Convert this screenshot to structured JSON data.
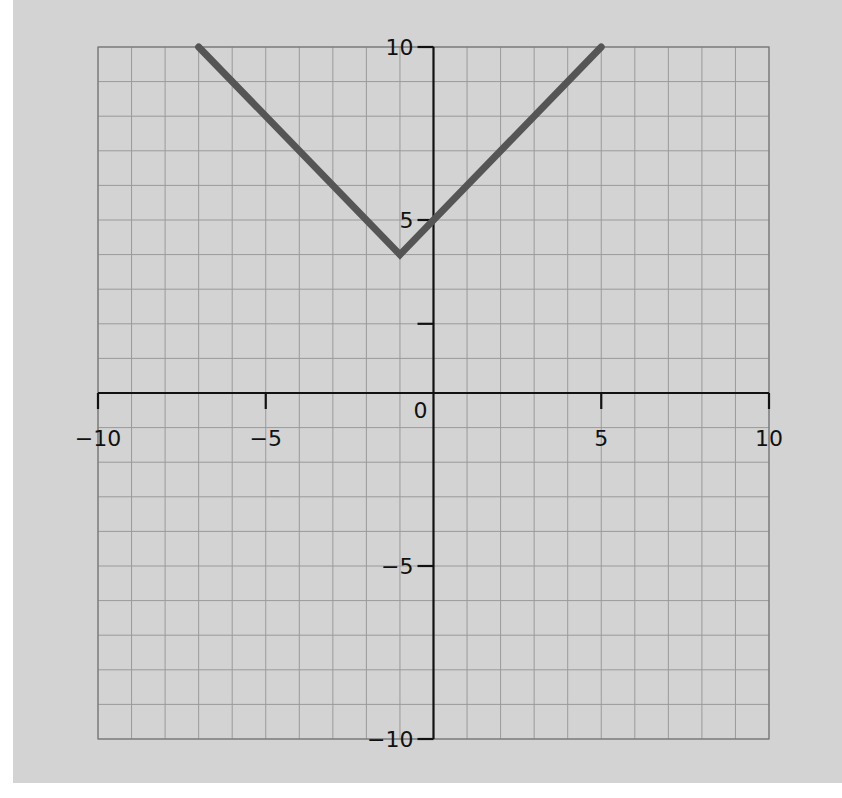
{
  "chart_data": {
    "type": "line",
    "title": "",
    "function": "y = |x + 1| + 4",
    "xlabel": "",
    "ylabel": "",
    "xlim": [
      -10,
      10
    ],
    "ylim": [
      -10,
      10
    ],
    "grid": true,
    "grid_step": 1,
    "legend": null,
    "x_ticks": [
      -10,
      -5,
      5,
      10
    ],
    "x_tick_labels": [
      "−10",
      "−5",
      "5",
      "10"
    ],
    "y_ticks": [
      -10,
      -5,
      2,
      5,
      10
    ],
    "y_tick_labels": [
      "−10",
      "−5",
      "",
      "5",
      "10"
    ],
    "origin_label": "0",
    "series": [
      {
        "name": "graph",
        "color": "#555555",
        "points": [
          [
            -7,
            10
          ],
          [
            -1,
            4
          ],
          [
            5,
            10
          ]
        ]
      }
    ]
  },
  "colors": {
    "background": "#d3d3d3",
    "grid": "#9a9a9a",
    "axis": "#111111",
    "line": "#555555"
  }
}
